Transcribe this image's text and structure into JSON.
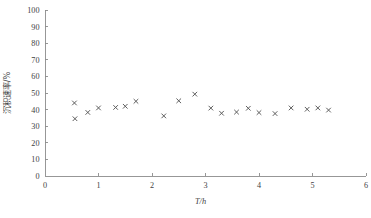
{
  "chart_data": {
    "type": "scatter",
    "title": "",
    "xlabel": "T/h",
    "ylabel": "沉积速率/%",
    "xlim": [
      0,
      6
    ],
    "ylim": [
      0,
      100
    ],
    "xticks": [
      0,
      1,
      2,
      3,
      4,
      5,
      6
    ],
    "yticks": [
      0,
      10,
      20,
      30,
      40,
      50,
      60,
      70,
      80,
      90,
      100
    ],
    "xtick_labels": [
      "0",
      "1",
      "2",
      "3",
      "4",
      "5",
      "6"
    ],
    "ytick_labels": [
      "0",
      "10",
      "20",
      "30",
      "40",
      "50",
      "60",
      "70",
      "80",
      "90",
      "100"
    ],
    "grid": false,
    "legend": null,
    "marker": "x",
    "marker_color": "#555555",
    "series": [
      {
        "name": "沉积速率",
        "points": [
          {
            "x": 0.55,
            "y": 44.0
          },
          {
            "x": 0.56,
            "y": 34.5
          },
          {
            "x": 0.8,
            "y": 38.3
          },
          {
            "x": 1.0,
            "y": 41.0
          },
          {
            "x": 1.32,
            "y": 41.3
          },
          {
            "x": 1.5,
            "y": 42.0
          },
          {
            "x": 1.7,
            "y": 45.0
          },
          {
            "x": 2.22,
            "y": 36.2
          },
          {
            "x": 2.5,
            "y": 45.3
          },
          {
            "x": 2.8,
            "y": 49.3
          },
          {
            "x": 3.1,
            "y": 40.9
          },
          {
            "x": 3.3,
            "y": 37.8
          },
          {
            "x": 3.58,
            "y": 38.5
          },
          {
            "x": 3.8,
            "y": 40.8
          },
          {
            "x": 4.0,
            "y": 38.2
          },
          {
            "x": 4.3,
            "y": 37.6
          },
          {
            "x": 4.6,
            "y": 41.0
          },
          {
            "x": 4.9,
            "y": 40.2
          },
          {
            "x": 5.1,
            "y": 41.0
          },
          {
            "x": 5.3,
            "y": 39.7
          }
        ]
      }
    ]
  }
}
